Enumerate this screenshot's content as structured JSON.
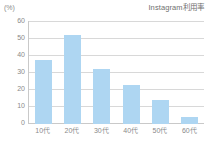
{
  "chart_data": {
    "type": "bar",
    "title": "Instagram利用率",
    "xlabel": "",
    "ylabel": "",
    "unit_label": "(%)",
    "categories": [
      "10代",
      "20代",
      "30代",
      "40代",
      "50代",
      "60代"
    ],
    "values": [
      37,
      52,
      32,
      23,
      14,
      4
    ],
    "ylim": [
      0,
      60
    ],
    "yticks": [
      60,
      50,
      40,
      30,
      20,
      10,
      0
    ],
    "ytick_labels": [
      "60",
      "50",
      "40",
      "30",
      "20",
      "10",
      "0"
    ],
    "grid": true,
    "legend": false,
    "bar_color": "#aed6f2",
    "grid_color": "#d8d8d8",
    "axis_color": "#c9c9c9",
    "text_color": "#8a8a8a"
  }
}
